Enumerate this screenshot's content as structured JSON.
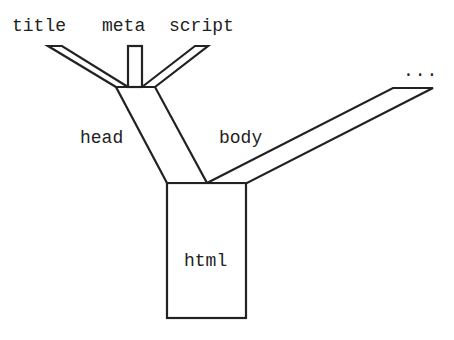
{
  "diagram": {
    "type": "tree",
    "root": {
      "label": "html",
      "children": [
        {
          "label": "head",
          "children": [
            {
              "label": "title"
            },
            {
              "label": "meta"
            },
            {
              "label": "script"
            }
          ]
        },
        {
          "label": "body",
          "children": [
            {
              "label": "..."
            }
          ]
        }
      ]
    }
  },
  "labels": {
    "title": "title",
    "meta": "meta",
    "script": "script",
    "head": "head",
    "body": "body",
    "ellipsis": "...",
    "html": "html"
  },
  "colors": {
    "stroke": "#222222",
    "background": "#ffffff"
  }
}
